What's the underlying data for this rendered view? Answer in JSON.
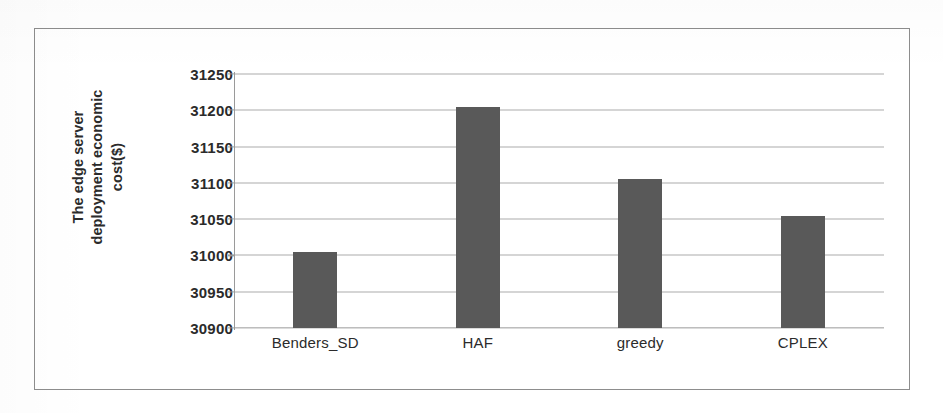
{
  "chart_data": {
    "type": "bar",
    "title": "",
    "subtitle": "",
    "xlabel": "",
    "ylabel": "The edge server deployment economic cost($)",
    "ylabel_lines": [
      "The edge server",
      "deployment economic",
      "cost($)"
    ],
    "categories": [
      "Benders_SD",
      "HAF",
      "greedy",
      "CPLEX"
    ],
    "values": [
      31005,
      31205,
      31105,
      31055
    ],
    "series": [
      {
        "name": "The edge server deployment economic cost($)",
        "values": [
          31005,
          31205,
          31105,
          31055
        ]
      }
    ],
    "ylim": [
      30900,
      31250
    ],
    "ytick_step": 50,
    "yticks": [
      31250,
      31200,
      31150,
      31100,
      31050,
      31000,
      30950,
      30900
    ],
    "ytick_labels": [
      "31250",
      "31200",
      "31150",
      "31100",
      "31050",
      "31000",
      "30950",
      "30900"
    ],
    "grid": true,
    "grid_axis": "y",
    "legend": false,
    "legend_position": "none",
    "bar_color": "#595959",
    "grid_color": "#a4a4a4",
    "axis_color": "#9a9a9a",
    "frame_color": "#8d8d8d",
    "text_color": "#2b2b2b",
    "background": "#ffffff",
    "annotations": []
  }
}
